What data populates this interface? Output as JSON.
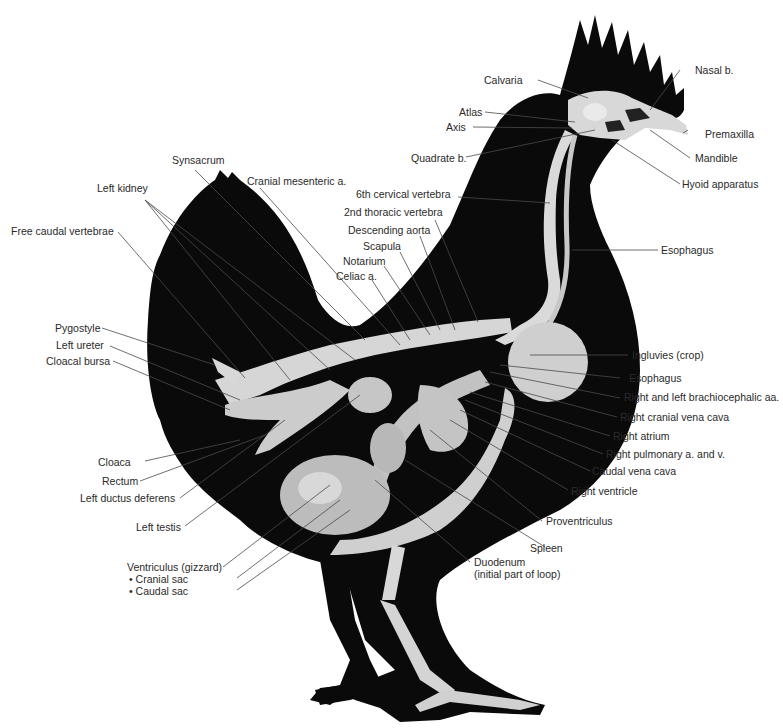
{
  "figure": {
    "colors": {
      "silhouette": "#0a0a0a",
      "bone": "#d9d9d9",
      "organ": "#bdbdbd",
      "leader": "#4a4a4a",
      "text": "#2a2a2a",
      "background": "#ffffff"
    },
    "labels": {
      "calvaria": "Calvaria",
      "nasal_b": "Nasal b.",
      "atlas": "Atlas",
      "axis": "Axis",
      "premaxilla": "Premaxilla",
      "mandible": "Mandible",
      "quadrate_b": "Quadrate b.",
      "hyoid_apparatus": "Hyoid apparatus",
      "synsacrum": "Synsacrum",
      "left_kidney": "Left kidney",
      "cranial_mesenteric_a": "Cranial mesenteric a.",
      "sixth_cervical_vertebra": "6th cervical vertebra",
      "free_caudal_vertebrae": "Free caudal vertebrae",
      "second_thoracic_vertebra": "2nd thoracic vertebra",
      "descending_aorta": "Descending aorta",
      "esophagus_neck": "Esophagus",
      "scapula": "Scapula",
      "notarium": "Notarium",
      "celiac_a": "Celiac a.",
      "pygostyle": "Pygostyle",
      "left_ureter": "Left ureter",
      "cloacal_bursa": "Cloacal bursa",
      "ingluvies": "Ingluvies (crop)",
      "esophagus_thorax": "Esophagus",
      "brachiocephalic": "Right and left brachiocephalic aa.",
      "right_cranial_vena_cava": "Right cranial vena cava",
      "right_atrium": "Right atrium",
      "right_pulmonary": "Right pulmonary a. and v.",
      "caudal_vena_cava": "Caudal vena cava",
      "right_ventricle": "Right ventricle",
      "cloaca": "Cloaca",
      "rectum": "Rectum",
      "left_ductus_deferens": "Left ductus deferens",
      "left_testis": "Left testis",
      "proventriculus": "Proventriculus",
      "spleen": "Spleen",
      "ventriculus": "Ventriculus (gizzard)",
      "cranial_sac": "• Cranial sac",
      "caudal_sac": "• Caudal sac",
      "duodenum_line1": "Duodenum",
      "duodenum_line2": "(initial part of loop)"
    }
  }
}
